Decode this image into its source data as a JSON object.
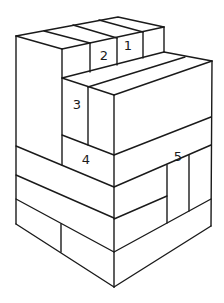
{
  "diagram": {
    "colors": {
      "stroke": "#1a1a1a",
      "background": "#ffffff"
    },
    "labels": [
      {
        "id": "1",
        "text": "1",
        "x": 128,
        "y": 46
      },
      {
        "id": "2",
        "text": "2",
        "x": 104,
        "y": 56
      },
      {
        "id": "3",
        "text": "3",
        "x": 77,
        "y": 105
      },
      {
        "id": "4",
        "text": "4",
        "x": 86,
        "y": 160
      },
      {
        "id": "5",
        "text": "5",
        "x": 178,
        "y": 157
      }
    ]
  }
}
